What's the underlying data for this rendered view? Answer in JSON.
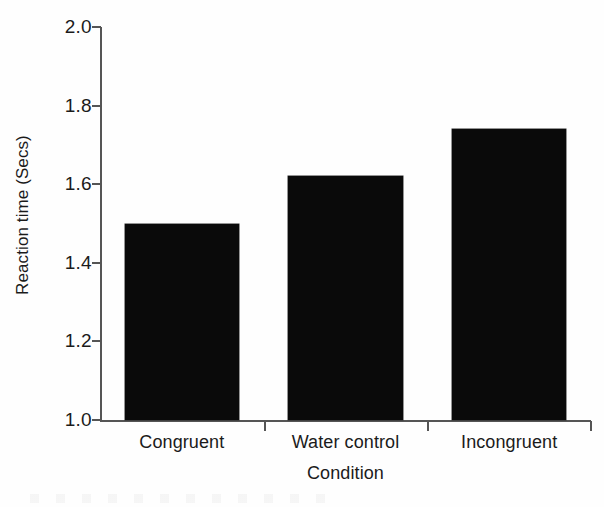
{
  "chart_data": {
    "type": "bar",
    "title": "",
    "subtitle": "",
    "xlabel": "Condition",
    "ylabel": "Reaction time (Secs)",
    "categories": [
      "Congruent",
      "Water control",
      "Incongruent"
    ],
    "values": [
      1.5,
      1.62,
      1.74
    ],
    "ylim": [
      1.0,
      2.0
    ],
    "ytick_labels": [
      "2.0",
      "1.8",
      "1.6",
      "1.4",
      "1.2",
      "1.0"
    ],
    "ytick_values": [
      2.0,
      1.8,
      1.6,
      1.4,
      1.2,
      1.0
    ],
    "grid": false,
    "legend": null,
    "legend_position": "none",
    "bar_color": "#0a0a0a",
    "axis_color": "#555555",
    "text_color": "#1b1b1b",
    "background_color": "#fefefe",
    "annotations": []
  }
}
